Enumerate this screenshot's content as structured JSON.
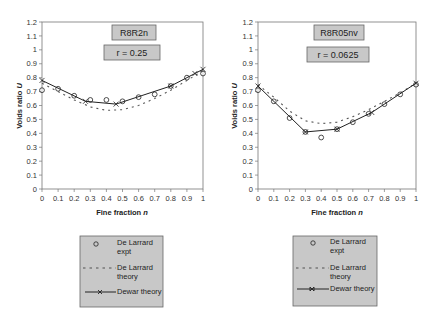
{
  "chart_data": [
    {
      "type": "line",
      "title": "R8R2n",
      "subtitle": "r = 0.25",
      "xlabel": "Fine fraction n",
      "ylabel": "Voids ratio U",
      "xlim": [
        0,
        1
      ],
      "ylim": [
        0,
        1.2
      ],
      "xticks": [
        "0",
        "0.1",
        "0.2",
        "0.3",
        "0.4",
        "0.5",
        "0.6",
        "0.7",
        "0.8",
        "0.9",
        "1"
      ],
      "yticks": [
        "0",
        "0.1",
        "0.2",
        "0.3",
        "0.4",
        "0.5",
        "0.6",
        "0.7",
        "0.8",
        "0.9",
        "1",
        "1.1",
        "1.2"
      ],
      "grid": false,
      "legend_position": "below",
      "series": [
        {
          "name": "De Larrard expt",
          "style": "circle-markers",
          "x": [
            0,
            0.1,
            0.2,
            0.3,
            0.4,
            0.5,
            0.6,
            0.7,
            0.8,
            0.9,
            1.0
          ],
          "y": [
            0.71,
            0.72,
            0.67,
            0.64,
            0.64,
            0.63,
            0.66,
            0.68,
            0.74,
            0.8,
            0.83
          ]
        },
        {
          "name": "De Larrard theory",
          "style": "dashed",
          "x": [
            0,
            0.1,
            0.2,
            0.3,
            0.4,
            0.5,
            0.6,
            0.7,
            0.8,
            0.9,
            1.0
          ],
          "y": [
            0.76,
            0.7,
            0.64,
            0.59,
            0.565,
            0.57,
            0.6,
            0.65,
            0.71,
            0.78,
            0.85
          ]
        },
        {
          "name": "Dewar theory",
          "style": "solid-x-markers",
          "x": [
            0,
            0.27,
            0.46,
            0.8,
            0.95,
            1.0
          ],
          "y": [
            0.78,
            0.63,
            0.61,
            0.74,
            0.83,
            0.86
          ]
        }
      ]
    },
    {
      "type": "line",
      "title": "R8R05nv",
      "subtitle": "r = 0.0625",
      "xlabel": "Fine fraction n",
      "ylabel": "Voids ratio U",
      "xlim": [
        0,
        1
      ],
      "ylim": [
        0,
        1.2
      ],
      "xticks": [
        "0",
        "0.1",
        "0.2",
        "0.3",
        "0.4",
        "0.5",
        "0.6",
        "0.7",
        "0.8",
        "0.9",
        "1"
      ],
      "yticks": [
        "0",
        "0.1",
        "0.2",
        "0.3",
        "0.4",
        "0.5",
        "0.6",
        "0.7",
        "0.8",
        "0.9",
        "1",
        "1.1",
        "1.2"
      ],
      "grid": false,
      "legend_position": "below",
      "series": [
        {
          "name": "De Larrard expt",
          "style": "circle-markers",
          "x": [
            0,
            0.1,
            0.2,
            0.3,
            0.4,
            0.5,
            0.6,
            0.7,
            0.8,
            0.9,
            1.0
          ],
          "y": [
            0.71,
            0.63,
            0.51,
            0.41,
            0.37,
            0.43,
            0.48,
            0.54,
            0.61,
            0.68,
            0.75
          ]
        },
        {
          "name": "De Larrard theory",
          "style": "dashed",
          "x": [
            0,
            0.1,
            0.2,
            0.3,
            0.4,
            0.5,
            0.6,
            0.7,
            0.8,
            0.9,
            1.0
          ],
          "y": [
            0.75,
            0.66,
            0.56,
            0.49,
            0.47,
            0.48,
            0.52,
            0.57,
            0.63,
            0.69,
            0.76
          ]
        },
        {
          "name": "Dewar theory",
          "style": "solid-x-markers",
          "x": [
            0,
            0.3,
            0.5,
            0.72,
            1.0
          ],
          "y": [
            0.74,
            0.41,
            0.43,
            0.55,
            0.76
          ]
        }
      ]
    }
  ],
  "charts": [
    {
      "title": "R8R2n",
      "subtitle": "r = 0.25",
      "xlabel": "Fine fraction ",
      "xlabel_var": "n",
      "ylabel": "Voids ratio ",
      "ylabel_var": "U",
      "legend": {
        "expt_1": "De Larrard",
        "expt_2": "expt",
        "theory_1": "De Larrard",
        "theory_2": "theory",
        "dewar": "Dewar theory"
      }
    },
    {
      "title": "R8R05nv",
      "subtitle": "r = 0.0625",
      "xlabel": "Fine fraction ",
      "xlabel_var": "n",
      "ylabel": "Voids ratio ",
      "ylabel_var": "U",
      "legend": {
        "expt_1": "De Larrard",
        "expt_2": "expt",
        "theory_1": "De Larrard",
        "theory_2": "theory",
        "dewar": "Dewar theory"
      }
    }
  ],
  "colors": {
    "line": "#222222",
    "dashed": "#555555",
    "box_fill": "#c8c8c8",
    "axis": "#777777"
  }
}
